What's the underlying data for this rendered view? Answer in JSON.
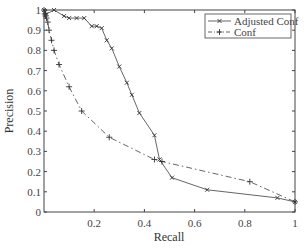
{
  "chart_data": {
    "type": "line",
    "title": "",
    "xlabel": "Recall",
    "ylabel": "Precision",
    "xlim": [
      0,
      1
    ],
    "ylim": [
      0,
      1
    ],
    "xticks": [
      "0.2",
      "0.4",
      "0.6",
      "0.8",
      "1"
    ],
    "yticks": [
      "0",
      "0.1",
      "0.2",
      "0.3",
      "0.4",
      "0.5",
      "0.6",
      "0.7",
      "0.8",
      "0.9",
      "1"
    ],
    "grid": false,
    "legend_position": "upper right",
    "series": [
      {
        "name": "Adjusted Conf",
        "style": "solid",
        "marker": "x",
        "color": "#555555",
        "x": [
          0.0,
          0.005,
          0.01,
          0.04,
          0.08,
          0.1,
          0.13,
          0.16,
          0.19,
          0.21,
          0.23,
          0.25,
          0.27,
          0.3,
          0.33,
          0.35,
          0.38,
          0.44,
          0.46,
          0.51,
          0.65,
          0.93,
          1.0
        ],
        "y": [
          1.0,
          0.99,
          0.98,
          1.0,
          0.97,
          0.96,
          0.96,
          0.96,
          0.92,
          0.92,
          0.91,
          0.85,
          0.81,
          0.72,
          0.64,
          0.58,
          0.49,
          0.38,
          0.26,
          0.17,
          0.11,
          0.07,
          0.05
        ]
      },
      {
        "name": "Conf",
        "style": "dashdot",
        "marker": "+",
        "color": "#555555",
        "x": [
          0.0,
          0.003,
          0.006,
          0.01,
          0.015,
          0.02,
          0.03,
          0.04,
          0.06,
          0.1,
          0.15,
          0.26,
          0.44,
          0.47,
          0.82,
          1.0
        ],
        "y": [
          1.0,
          0.98,
          0.97,
          0.96,
          0.94,
          0.9,
          0.85,
          0.8,
          0.73,
          0.62,
          0.5,
          0.37,
          0.26,
          0.25,
          0.15,
          0.05
        ]
      }
    ]
  }
}
